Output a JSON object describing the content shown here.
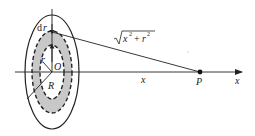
{
  "diagram": {
    "type": "physics-figure",
    "colors": {
      "line": "#222222",
      "ring_fill": "#c8c8c8",
      "background": "#ffffff"
    },
    "labels": {
      "dr": "dr",
      "r": "r",
      "origin": "O",
      "radius": "R",
      "distance": "x",
      "point": "P",
      "axis": "x",
      "hypotenuse_base": "x",
      "hypotenuse_term2": "r",
      "exponent": "2",
      "plus": "+"
    }
  }
}
